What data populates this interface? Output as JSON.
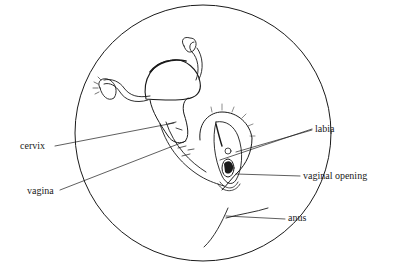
{
  "diagram": {
    "type": "anatomical line illustration",
    "colors": {
      "ink": "#1a1a1a",
      "background": "#ffffff"
    },
    "labels": [
      {
        "id": "cervix",
        "text": "cervix",
        "x": 20,
        "y": 141
      },
      {
        "id": "vagina",
        "text": "vagina",
        "x": 27,
        "y": 186
      },
      {
        "id": "labia",
        "text": "labia",
        "x": 315,
        "y": 124
      },
      {
        "id": "vaginal_opening",
        "text": "vaginal opening",
        "x": 303,
        "y": 171
      },
      {
        "id": "anus",
        "text": "anus",
        "x": 288,
        "y": 213
      }
    ]
  }
}
